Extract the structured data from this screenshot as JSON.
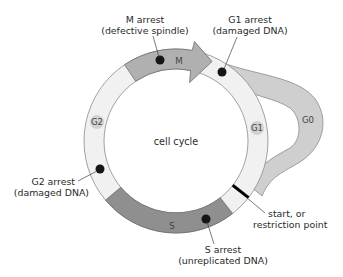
{
  "diagram": {
    "title": "cell cycle",
    "colors": {
      "ring_fill": "#f1f1f1",
      "ring_stroke": "#8a8a8a",
      "m_phase": "#b0b0b0",
      "s_phase": "#8f8f8f",
      "g0_loop": "#cfcfcf",
      "phase_badge": "#d2d2d2",
      "checkpoint_dot": "#151515",
      "restriction_bar": "#000000"
    },
    "phases": [
      {
        "id": "M",
        "label": "M"
      },
      {
        "id": "G1",
        "label": "G1"
      },
      {
        "id": "S",
        "label": "S"
      },
      {
        "id": "G2",
        "label": "G2"
      },
      {
        "id": "G0",
        "label": "G0"
      }
    ],
    "checkpoints": [
      {
        "id": "m-arrest",
        "line1": "M arrest",
        "line2": "(defective spindle)"
      },
      {
        "id": "g1-arrest",
        "line1": "G1 arrest",
        "line2": "(damaged DNA)"
      },
      {
        "id": "g2-arrest",
        "line1": "G2 arrest",
        "line2": "(damaged DNA)"
      },
      {
        "id": "s-arrest",
        "line1": "S arrest",
        "line2": "(unreplicated DNA)"
      }
    ],
    "restriction_point": {
      "line1": "start, or",
      "line2": "restriction point"
    }
  }
}
